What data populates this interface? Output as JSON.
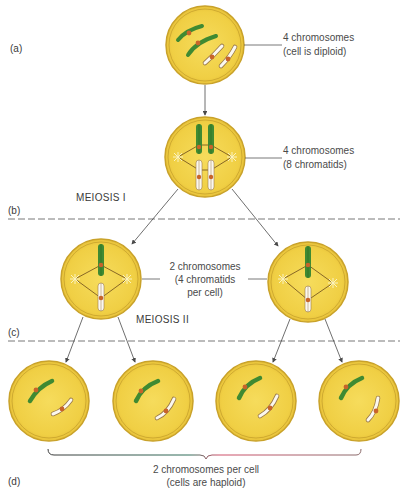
{
  "figure": {
    "panels": [
      {
        "tag": "(a)",
        "label_line1": "4 chromosomes",
        "label_line2": "(cell is diploid)"
      },
      {
        "tag": "(b)",
        "label_line1": "4 chromosomes",
        "label_line2": "(8 chromatids)"
      },
      {
        "tag": "(c)",
        "label_line1": "2 chromosomes",
        "label_line2": "(4 chromatids",
        "label_line3": "per cell)"
      },
      {
        "tag": "(d)",
        "label_line1": "2 chromosomes per cell",
        "label_line2": "(cells are haploid)"
      }
    ],
    "stages": {
      "meiosis_1": "MEIOSIS I",
      "meiosis_2": "MEIOSIS II"
    },
    "colors": {
      "cell_fill": "#f0cf44",
      "cell_outline": "#c9a22a",
      "maternal_chromosome": "#3f8a32",
      "paternal_chromosome": "#fbf8ef",
      "centromere": "#c8642a",
      "spindle": "#6b4a1a",
      "arrow": "#4a4a4a",
      "divider": "#6a6a6a",
      "brace_left": "#2f6e5a",
      "brace_right": "#d0506a"
    }
  }
}
